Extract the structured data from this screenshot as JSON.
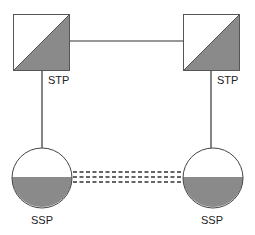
{
  "diagram": {
    "nodes": [
      {
        "id": "stp-left",
        "type": "STP",
        "label": "STP"
      },
      {
        "id": "stp-right",
        "type": "STP",
        "label": "STP"
      },
      {
        "id": "ssp-left",
        "type": "SSP",
        "label": "SSP"
      },
      {
        "id": "ssp-right",
        "type": "SSP",
        "label": "SSP"
      }
    ],
    "links": [
      {
        "from": "stp-left",
        "to": "stp-right",
        "style": "solid"
      },
      {
        "from": "stp-left",
        "to": "ssp-left",
        "style": "solid"
      },
      {
        "from": "stp-right",
        "to": "ssp-right",
        "style": "solid"
      },
      {
        "from": "ssp-left",
        "to": "ssp-right",
        "style": "triple-dashed"
      }
    ],
    "colors": {
      "fill": "#8a8a8a",
      "stroke": "#333333",
      "background": "#ffffff"
    }
  }
}
